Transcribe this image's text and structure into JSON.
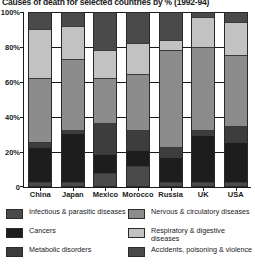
{
  "title": "Causes of death for selected countries by % (1992-94)",
  "axis": {
    "y_ticks": [
      "0",
      "20%",
      "40%",
      "60%",
      "80%",
      "100%"
    ],
    "y_tick_values": [
      0,
      20,
      40,
      60,
      80,
      100
    ]
  },
  "legend": {
    "left": [
      {
        "label": "Infectious & parasitic diseases",
        "key": "infectious",
        "color": "#4a4a4a"
      },
      {
        "label": "Cancers",
        "key": "cancers",
        "color": "#1d1d1d"
      },
      {
        "label": "Metabolic disorders",
        "key": "metabolic",
        "color": "#3d3d3d"
      }
    ],
    "right": [
      {
        "label": "Nervous & circulatory diseases",
        "key": "nervous",
        "color": "#8c8c8c"
      },
      {
        "label": "Respiratory & digestive diseases",
        "key": "respiratory",
        "color": "#c2c2c2"
      },
      {
        "label": "Accidents, poisoning & violence",
        "key": "accidents",
        "color": "#4a4a4a"
      }
    ]
  },
  "chart_data": {
    "type": "bar",
    "subtype": "stacked-percent",
    "title": "Causes of death for selected countries by % (1992-94)",
    "xlabel": "",
    "ylabel": "",
    "ylim": [
      0,
      100
    ],
    "ytick_labels": [
      "0",
      "20%",
      "40%",
      "60%",
      "80%",
      "100%"
    ],
    "grid": false,
    "legend_position": "bottom",
    "categories": [
      "China",
      "Japan",
      "Mexico",
      "Morocco",
      "Russia",
      "UK",
      "USA"
    ],
    "series": [
      {
        "name": "Infectious & parasitic diseases",
        "color": "#4a4a4a",
        "values": [
          2,
          2,
          7,
          11,
          2,
          2,
          2
        ]
      },
      {
        "name": "Cancers",
        "color": "#1d1d1d",
        "values": [
          20,
          28,
          11,
          9,
          14,
          27,
          23
        ]
      },
      {
        "name": "Metabolic disorders",
        "color": "#3d3d3d",
        "values": [
          3,
          2,
          18,
          12,
          6,
          3,
          9
        ]
      },
      {
        "name": "Nervous & circulatory diseases",
        "color": "#8c8c8c",
        "values": [
          37,
          41,
          26,
          32,
          56,
          48,
          41
        ]
      },
      {
        "name": "Respiratory & digestive diseases",
        "color": "#c2c2c2",
        "values": [
          28,
          19,
          16,
          18,
          6,
          17,
          19
        ]
      },
      {
        "name": "Accidents, poisoning & violence",
        "color": "#4a4a4a",
        "values": [
          10,
          8,
          22,
          18,
          16,
          3,
          6
        ]
      }
    ]
  }
}
